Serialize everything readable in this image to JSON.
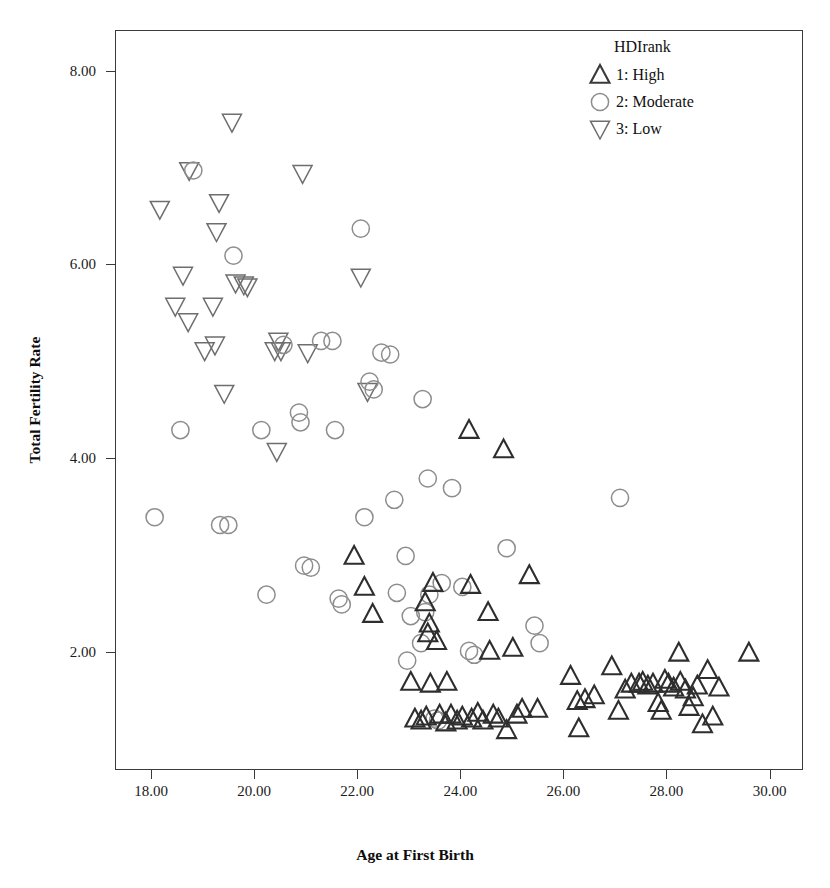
{
  "chart_data": {
    "type": "scatter",
    "title": "",
    "xlabel": "Age at First Birth",
    "ylabel": "Total Fertility Rate",
    "xlim": [
      17.3,
      30.65
    ],
    "ylim": [
      0.78,
      8.42
    ],
    "xticks": [
      "18.00",
      "20.00",
      "22.00",
      "24.00",
      "26.00",
      "28.00",
      "30.00"
    ],
    "xtick_values": [
      18,
      20,
      22,
      24,
      26,
      28,
      30
    ],
    "yticks": [
      "2.00",
      "4.00",
      "6.00",
      "8.00"
    ],
    "ytick_values": [
      2,
      4,
      6,
      8
    ],
    "grid": false,
    "legend_position": "top-right",
    "legend": {
      "title": "HDIrank",
      "entries": [
        {
          "label": "1: High",
          "marker": "triangle-up",
          "color": "#3a3a3a"
        },
        {
          "label": "2: Moderate",
          "marker": "circle",
          "color": "#8d8d8d"
        },
        {
          "label": "3: Low",
          "marker": "triangle-down",
          "color": "#6e6e6e"
        }
      ]
    },
    "series": [
      {
        "name": "3: Low",
        "marker": "triangle-down",
        "color": "#6e6e6e",
        "points": [
          [
            18.15,
            6.58
          ],
          [
            18.72,
            6.98
          ],
          [
            18.6,
            5.9
          ],
          [
            18.45,
            5.58
          ],
          [
            18.7,
            5.42
          ],
          [
            19.02,
            5.12
          ],
          [
            19.3,
            6.65
          ],
          [
            19.25,
            6.35
          ],
          [
            19.18,
            5.58
          ],
          [
            19.22,
            5.18
          ],
          [
            19.4,
            4.68
          ],
          [
            19.55,
            7.48
          ],
          [
            19.62,
            5.82
          ],
          [
            19.78,
            5.8
          ],
          [
            19.85,
            5.78
          ],
          [
            20.45,
            5.22
          ],
          [
            20.38,
            5.12
          ],
          [
            20.5,
            5.12
          ],
          [
            20.42,
            4.08
          ],
          [
            20.92,
            6.95
          ],
          [
            21.02,
            5.1
          ],
          [
            22.05,
            5.88
          ],
          [
            22.18,
            4.7
          ]
        ]
      },
      {
        "name": "2: Moderate",
        "marker": "circle",
        "color": "#8d8d8d",
        "points": [
          [
            18.05,
            3.4
          ],
          [
            18.8,
            6.98
          ],
          [
            18.55,
            4.3
          ],
          [
            19.58,
            6.1
          ],
          [
            19.32,
            3.32
          ],
          [
            19.48,
            3.32
          ],
          [
            20.12,
            4.3
          ],
          [
            20.22,
            2.6
          ],
          [
            20.55,
            5.18
          ],
          [
            20.85,
            4.48
          ],
          [
            20.88,
            4.38
          ],
          [
            20.95,
            2.9
          ],
          [
            21.08,
            2.88
          ],
          [
            21.28,
            5.22
          ],
          [
            21.5,
            5.22
          ],
          [
            21.55,
            4.3
          ],
          [
            21.62,
            2.56
          ],
          [
            21.68,
            2.5
          ],
          [
            22.05,
            6.38
          ],
          [
            22.22,
            4.8
          ],
          [
            22.3,
            4.72
          ],
          [
            22.12,
            3.4
          ],
          [
            22.45,
            5.1
          ],
          [
            22.62,
            5.08
          ],
          [
            22.7,
            3.58
          ],
          [
            22.92,
            3.0
          ],
          [
            22.75,
            2.62
          ],
          [
            23.02,
            2.38
          ],
          [
            22.95,
            1.92
          ],
          [
            23.25,
            4.62
          ],
          [
            23.35,
            3.8
          ],
          [
            23.38,
            2.6
          ],
          [
            23.3,
            2.42
          ],
          [
            23.22,
            2.1
          ],
          [
            23.48,
            1.32
          ],
          [
            23.55,
            1.3
          ],
          [
            23.62,
            2.72
          ],
          [
            23.82,
            3.7
          ],
          [
            24.02,
            2.68
          ],
          [
            24.15,
            2.02
          ],
          [
            24.25,
            1.98
          ],
          [
            24.88,
            3.08
          ],
          [
            25.42,
            2.28
          ],
          [
            25.52,
            2.1
          ],
          [
            27.08,
            3.6
          ]
        ]
      },
      {
        "name": "1: High",
        "marker": "triangle-up",
        "color": "#2e2e2e",
        "points": [
          [
            21.92,
            3.0
          ],
          [
            22.12,
            2.68
          ],
          [
            22.28,
            2.4
          ],
          [
            23.02,
            1.7
          ],
          [
            23.1,
            1.32
          ],
          [
            23.22,
            1.3
          ],
          [
            23.32,
            1.34
          ],
          [
            23.4,
            1.68
          ],
          [
            23.35,
            2.2
          ],
          [
            23.38,
            2.3
          ],
          [
            23.3,
            2.52
          ],
          [
            23.45,
            2.72
          ],
          [
            23.52,
            2.12
          ],
          [
            23.58,
            1.36
          ],
          [
            23.7,
            1.28
          ],
          [
            23.72,
            1.7
          ],
          [
            23.8,
            1.36
          ],
          [
            23.92,
            1.3
          ],
          [
            24.02,
            1.34
          ],
          [
            24.15,
            4.3
          ],
          [
            24.18,
            2.7
          ],
          [
            24.2,
            1.32
          ],
          [
            24.32,
            1.38
          ],
          [
            24.42,
            1.3
          ],
          [
            24.52,
            2.42
          ],
          [
            24.55,
            2.02
          ],
          [
            24.62,
            1.36
          ],
          [
            24.72,
            1.32
          ],
          [
            24.82,
            4.1
          ],
          [
            24.88,
            1.2
          ],
          [
            25.0,
            2.05
          ],
          [
            25.08,
            1.36
          ],
          [
            25.18,
            1.42
          ],
          [
            25.32,
            2.8
          ],
          [
            25.48,
            1.42
          ],
          [
            26.12,
            1.76
          ],
          [
            26.25,
            1.5
          ],
          [
            26.28,
            1.22
          ],
          [
            26.4,
            1.52
          ],
          [
            26.58,
            1.56
          ],
          [
            26.92,
            1.86
          ],
          [
            27.05,
            1.4
          ],
          [
            27.18,
            1.62
          ],
          [
            27.3,
            1.68
          ],
          [
            27.45,
            1.68
          ],
          [
            27.52,
            1.7
          ],
          [
            27.62,
            1.66
          ],
          [
            27.72,
            1.68
          ],
          [
            27.82,
            1.48
          ],
          [
            27.88,
            1.4
          ],
          [
            27.95,
            1.72
          ],
          [
            28.02,
            1.68
          ],
          [
            28.12,
            1.64
          ],
          [
            28.22,
            2.0
          ],
          [
            28.25,
            1.7
          ],
          [
            28.35,
            1.62
          ],
          [
            28.42,
            1.44
          ],
          [
            28.5,
            1.54
          ],
          [
            28.58,
            1.66
          ],
          [
            28.68,
            1.26
          ],
          [
            28.78,
            1.82
          ],
          [
            28.88,
            1.34
          ],
          [
            29.0,
            1.64
          ],
          [
            29.58,
            2.0
          ]
        ]
      }
    ]
  }
}
